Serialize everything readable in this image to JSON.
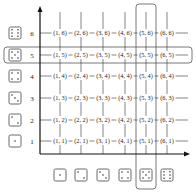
{
  "diagram": {
    "x_axis": {
      "label": "First die",
      "values": [
        1,
        2,
        3,
        4,
        5,
        6
      ]
    },
    "y_axis": {
      "label": "Second die",
      "values": [
        1,
        2,
        3,
        4,
        5,
        6
      ]
    },
    "highlighted_row": 5,
    "highlighted_column": 5,
    "rows": [
      {
        "y": 6,
        "cells": [
          "(1, 6)",
          "(2, 6)",
          "(3, 6)",
          "(4, 6)",
          "(5, 6)",
          "(6, 6)"
        ]
      },
      {
        "y": 5,
        "cells": [
          "(1, 5)",
          "(2, 5)",
          "(3, 5)",
          "(4, 5)",
          "(5, 5)",
          "(6, 5)"
        ]
      },
      {
        "y": 4,
        "cells": [
          "(1, 4)",
          "(2, 4)",
          "(3, 4)",
          "(4, 4)",
          "(5, 4)",
          "(6, 4)"
        ]
      },
      {
        "y": 3,
        "cells": [
          "(1, 3)",
          "(2, 3)",
          "(3, 3)",
          "(4, 3)",
          "(5, 3)",
          "(6, 3)"
        ]
      },
      {
        "y": 2,
        "cells": [
          "(1, 2)",
          "(2, 2)",
          "(3, 2)",
          "(4, 2)",
          "(5, 2)",
          "(6, 2)"
        ]
      },
      {
        "y": 1,
        "cells": [
          "(1, 1)",
          "(2, 1)",
          "(3, 1)",
          "(4, 1)",
          "(5, 1)",
          "(6, 1)"
        ]
      }
    ],
    "row_numbers": [
      "6",
      "5",
      "4",
      "3",
      "2",
      "1"
    ],
    "dice_icons": [
      "die-face-1",
      "die-face-2",
      "die-face-3",
      "die-face-4",
      "die-face-5",
      "die-face-6"
    ]
  }
}
